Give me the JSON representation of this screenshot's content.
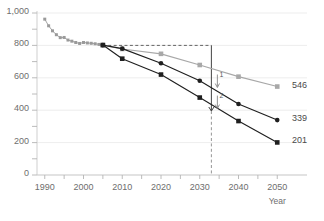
{
  "chart_data": {
    "type": "line",
    "title": "",
    "xlabel": "Year",
    "ylabel": "",
    "xlim": [
      1988,
      2052
    ],
    "ylim": [
      0,
      1000
    ],
    "grid": true,
    "legend_position": "end-of-line labels",
    "x_ticks": [
      "1990",
      "2000",
      "2010",
      "2020",
      "2030",
      "2040",
      "2050"
    ],
    "x_tick_values": [
      1990,
      2000,
      2010,
      2020,
      2030,
      2040,
      2050
    ],
    "y_ticks": [
      "0",
      "200",
      "400",
      "600",
      "800",
      "1,000"
    ],
    "y_tick_values": [
      0,
      200,
      400,
      600,
      800,
      1000
    ],
    "y_minor_ticks": [
      100,
      300,
      500,
      700,
      900
    ],
    "series": [
      {
        "name": "historical",
        "color": "#9a9a9a",
        "marker": "square",
        "x": [
          1990,
          1991,
          1992,
          1993,
          1994,
          1995,
          1996,
          1997,
          1998,
          1999,
          2000,
          2001,
          2002,
          2003,
          2004,
          2005
        ],
        "values": [
          962,
          921,
          890,
          866,
          848,
          849,
          833,
          826,
          818,
          812,
          818,
          815,
          813,
          810,
          806,
          802
        ]
      },
      {
        "name": "projection-upper",
        "color": "#a8a8a8",
        "marker": "square",
        "end_label": "546",
        "x": [
          2005,
          2010,
          2020,
          2030,
          2040,
          2050
        ],
        "values": [
          802,
          778,
          748,
          679,
          607,
          546
        ]
      },
      {
        "name": "projection-middle",
        "color": "#1f1f1f",
        "marker": "circle",
        "end_label": "339",
        "x": [
          2005,
          2010,
          2020,
          2030,
          2040,
          2050
        ],
        "values": [
          802,
          780,
          690,
          582,
          438,
          339
        ]
      },
      {
        "name": "projection-lower",
        "color": "#1f1f1f",
        "marker": "square",
        "end_label": "201",
        "x": [
          2005,
          2010,
          2020,
          2030,
          2040,
          2050
        ],
        "values": [
          802,
          718,
          620,
          478,
          333,
          201
        ]
      }
    ],
    "annotations": [
      {
        "label": "1",
        "type": "gap-arrow",
        "x": 2033,
        "from": 800,
        "to": 540
      },
      {
        "label": "2",
        "type": "gap-arrow",
        "x": 2033,
        "from": 800,
        "to": 410
      }
    ],
    "reference_lines": [
      {
        "name": "baseline-800",
        "orientation": "horizontal",
        "value": 800,
        "style": "dashed",
        "x_from": 2005,
        "x_to": 2033
      },
      {
        "name": "target-year",
        "orientation": "vertical",
        "value": 2033,
        "style": "solid-then-dashed"
      }
    ]
  }
}
